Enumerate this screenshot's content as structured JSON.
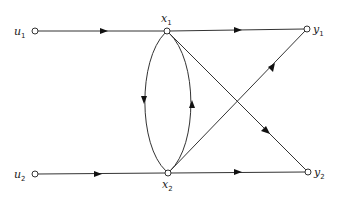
{
  "diagram": {
    "type": "signal-flow-graph",
    "nodes": [
      {
        "id": "u1",
        "label": "u",
        "sub": "1",
        "x": 35,
        "y": 31
      },
      {
        "id": "x1",
        "label": "x",
        "sub": "1",
        "x": 167,
        "y": 31
      },
      {
        "id": "y1",
        "label": "y",
        "sub": "1",
        "x": 307,
        "y": 29
      },
      {
        "id": "u2",
        "label": "u",
        "sub": "2",
        "x": 35,
        "y": 174
      },
      {
        "id": "x2",
        "label": "x",
        "sub": "2",
        "x": 168,
        "y": 173
      },
      {
        "id": "y2",
        "label": "y",
        "sub": "2",
        "x": 308,
        "y": 172
      }
    ],
    "edges": [
      {
        "from": "u1",
        "to": "x1"
      },
      {
        "from": "x1",
        "to": "y1"
      },
      {
        "from": "x1",
        "to": "x2",
        "curve": "left"
      },
      {
        "from": "x2",
        "to": "x1",
        "curve": "right"
      },
      {
        "from": "x1",
        "to": "y2"
      },
      {
        "from": "x2",
        "to": "y1"
      },
      {
        "from": "u2",
        "to": "x2"
      },
      {
        "from": "x2",
        "to": "y2"
      }
    ]
  }
}
